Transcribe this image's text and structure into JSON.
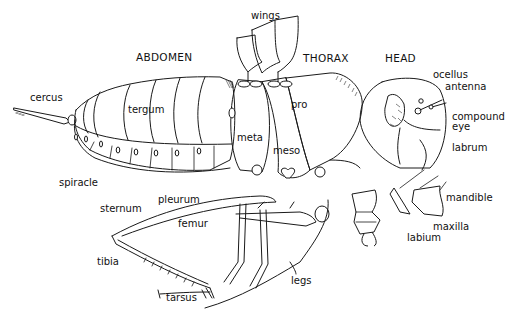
{
  "diagram": {
    "sections": {
      "abdomen": "ABDOMEN",
      "thorax": "THORAX",
      "head": "HEAD"
    },
    "labels": {
      "wings": "wings",
      "cercus": "cercus",
      "tergum": "tergum",
      "spiracle": "spiracle",
      "sternum": "sternum",
      "pleurum": "pleurum",
      "meta": "meta",
      "meso": "meso",
      "pro": "pro",
      "ocellus": "ocellus",
      "antenna": "antenna",
      "compound_eye_line1": "compound",
      "compound_eye_line2": "eye",
      "labrum": "labrum",
      "mandible": "mandible",
      "maxilla": "maxilla",
      "labium": "labium",
      "femur": "femur",
      "tibia": "tibia",
      "tarsus": "tarsus",
      "legs": "legs"
    },
    "colors": {
      "ink": "#1a1a1a",
      "background": "#ffffff"
    }
  }
}
